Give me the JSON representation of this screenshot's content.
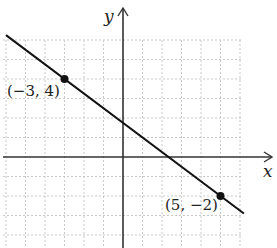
{
  "chart_data": {
    "type": "line",
    "title": "",
    "xlabel": "x",
    "ylabel": "y",
    "xlim": [
      -6,
      6
    ],
    "ylim": [
      -4.5,
      6
    ],
    "grid": true,
    "series": [
      {
        "name": "line",
        "equation": "y = -3/4 x + 7/4",
        "x": [
          -6,
          -3,
          5,
          6.2
        ],
        "y": [
          6.25,
          4,
          -2,
          -2.9
        ]
      }
    ],
    "points": [
      {
        "x": -3,
        "y": 4,
        "label": "(−3, 4)"
      },
      {
        "x": 5,
        "y": -2,
        "label": "(5, −2)"
      }
    ],
    "colors": {
      "line": "#111111",
      "axis": "#333333",
      "grid": "#c8c8c8"
    }
  },
  "labels": {
    "x_axis": "x",
    "y_axis": "y",
    "point1": "(−3, 4)",
    "point2": "(5, −2)"
  }
}
